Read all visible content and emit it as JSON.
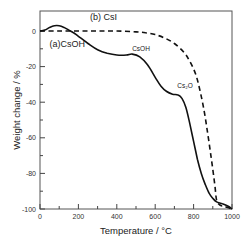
{
  "chart_data": {
    "type": "line",
    "title": "",
    "xlabel": "Temperature / °C",
    "ylabel": "Weight change / %",
    "xlim": [
      0,
      1000
    ],
    "ylim": [
      -100,
      10
    ],
    "grid": false,
    "legend": "inline labels",
    "x_ticks": [
      0,
      200,
      400,
      600,
      800,
      1000
    ],
    "x_tick_labels": [
      "0",
      "200",
      "400",
      "600",
      "800",
      "1000"
    ],
    "x_minor_ticks": [
      100,
      300,
      500,
      700,
      900
    ],
    "y_ticks": [
      0,
      -20,
      -40,
      -60,
      -80,
      -100
    ],
    "y_tick_labels": [
      "0",
      "-20",
      "-40",
      "-60",
      "-80",
      "-100"
    ],
    "y_minor_ticks": [
      -10,
      -30,
      -50,
      -70,
      -90
    ],
    "series": [
      {
        "name": "(a)CsOH",
        "style": "solid",
        "x": [
          0,
          25,
          50,
          75,
          100,
          125,
          150,
          175,
          200,
          250,
          300,
          350,
          400,
          450,
          480,
          520,
          560,
          600,
          630,
          660,
          690,
          720,
          740,
          760,
          780,
          800,
          820,
          840,
          860,
          880,
          900,
          920,
          950,
          980,
          1000
        ],
        "values": [
          0,
          0.5,
          2,
          3,
          3,
          2,
          0.5,
          -1,
          -3,
          -7,
          -10.5,
          -12.5,
          -13.5,
          -13.5,
          -13,
          -14.5,
          -19,
          -26,
          -31,
          -34,
          -35.5,
          -36,
          -38,
          -43,
          -52,
          -62,
          -72,
          -80,
          -86,
          -91,
          -94,
          -96,
          -97,
          -98.5,
          -100
        ]
      },
      {
        "name": "(b) CsI",
        "style": "dashed",
        "x": [
          0,
          100,
          200,
          300,
          400,
          500,
          550,
          600,
          650,
          700,
          750,
          780,
          810,
          830,
          850,
          870,
          890,
          910,
          920,
          940,
          960,
          1000
        ],
        "values": [
          0,
          0,
          0,
          0,
          0,
          -0.5,
          -1,
          -2,
          -4,
          -7,
          -12,
          -17,
          -24,
          -32,
          -42,
          -55,
          -70,
          -86,
          -95,
          -98,
          -98.5,
          -100
        ]
      }
    ],
    "annotations": [
      {
        "text": "(b) CsI",
        "x": 260,
        "y": 6
      },
      {
        "text": "(a)CsOH",
        "x": 50,
        "y": -9
      },
      {
        "text": "CsOH",
        "x": 480,
        "y": -11
      },
      {
        "text": "Cs₂O",
        "x": 715,
        "y": -32
      }
    ]
  },
  "labels": {
    "xlabel": "Temperature / °C",
    "ylabel": "Weight change / %",
    "series_a": "(a)CsOH",
    "series_b": "(b) CsI",
    "anno_csoh": "CsOH",
    "anno_cs2o": "Cs₂O"
  },
  "colors": {
    "line": "#111111",
    "axis": "#333333",
    "background": "#ffffff"
  }
}
